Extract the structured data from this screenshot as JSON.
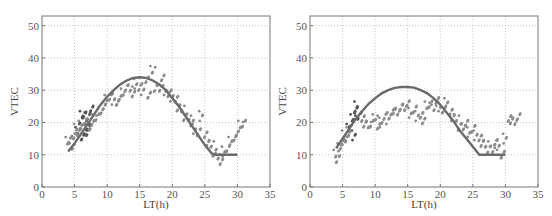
{
  "chart_data": [
    {
      "type": "scatter",
      "title": "",
      "xlabel": "LT(h)",
      "ylabel": "VTEC",
      "xlim": [
        0,
        35
      ],
      "ylim": [
        0,
        53
      ],
      "xticks": [
        0,
        5,
        10,
        15,
        20,
        25,
        30,
        35
      ],
      "yticks": [
        0,
        10,
        20,
        30,
        40,
        50
      ],
      "grid": true,
      "series": [
        {
          "name": "model curve",
          "kind": "line",
          "color": "#6a6a6a",
          "x": [
            4,
            5,
            6,
            7,
            8,
            9,
            10,
            11,
            12,
            13,
            14,
            15,
            16,
            17,
            18,
            19,
            20,
            21,
            22,
            23,
            24,
            25,
            26,
            26.5,
            27,
            28,
            29,
            30
          ],
          "y": [
            11,
            13.5,
            16.5,
            19.5,
            22.5,
            25.5,
            28,
            30,
            31.8,
            33,
            33.8,
            34,
            33.8,
            33,
            31.8,
            30,
            27.5,
            25,
            22,
            19,
            16,
            13,
            10.5,
            10,
            10,
            10,
            10,
            10
          ]
        },
        {
          "name": "observed (dark)",
          "kind": "scatter",
          "color": "#555555",
          "x": [
            5.5,
            6,
            6.2,
            6.5,
            6.8,
            7,
            7.2,
            7.5,
            6.3,
            6.6,
            7.1
          ],
          "y": [
            17,
            21,
            22,
            22.5,
            18,
            17,
            19,
            24,
            16,
            20,
            22
          ]
        },
        {
          "name": "observed (light)",
          "kind": "scatter",
          "color": "#8c8c8c",
          "x": [
            4,
            4.3,
            4.6,
            5,
            5.3,
            5.6,
            6,
            6.5,
            7.5,
            8,
            8.5,
            9,
            9.5,
            10,
            10.5,
            11,
            11.5,
            12,
            12.5,
            13,
            13.5,
            14,
            14.5,
            15,
            15.5,
            16,
            16.5,
            17,
            17.5,
            18,
            18.5,
            19,
            19.5,
            20,
            20.5,
            21,
            21.5,
            22,
            22.5,
            23,
            23.5,
            24,
            24.5,
            25,
            25.5,
            26,
            26.5,
            27,
            27.5,
            28,
            28.5,
            29,
            29.5,
            30,
            30.5,
            31
          ],
          "y": [
            14,
            15,
            12,
            16,
            18,
            17,
            19,
            20,
            19,
            21,
            22,
            23,
            25,
            27,
            28,
            27,
            26,
            28,
            29,
            31,
            30,
            29,
            32,
            31,
            30,
            33,
            29,
            36,
            31,
            30,
            34,
            30,
            29,
            28,
            27,
            25,
            24,
            22,
            21,
            20,
            18,
            17,
            22,
            16,
            14,
            13,
            11,
            9,
            8,
            11,
            12,
            14,
            15,
            17,
            19,
            20
          ]
        }
      ]
    },
    {
      "type": "scatter",
      "title": "",
      "xlabel": "LT(h)",
      "ylabel": "VTEC",
      "xlim": [
        0,
        35
      ],
      "ylim": [
        0,
        53
      ],
      "xticks": [
        0,
        5,
        10,
        15,
        20,
        25,
        30,
        35
      ],
      "yticks": [
        0,
        10,
        20,
        30,
        40,
        50
      ],
      "grid": true,
      "series": [
        {
          "name": "model curve",
          "kind": "line",
          "color": "#6a6a6a",
          "x": [
            4,
            5,
            6,
            7,
            8,
            9,
            10,
            11,
            12,
            13,
            14,
            15,
            16,
            17,
            18,
            19,
            20,
            21,
            22,
            23,
            24,
            25,
            26,
            27,
            28,
            29,
            30
          ],
          "y": [
            12,
            15,
            18,
            21,
            23.5,
            25.8,
            27.5,
            29,
            30,
            30.7,
            31,
            31,
            30.8,
            30,
            29,
            27.5,
            25.5,
            23,
            20.5,
            17.5,
            15,
            12.5,
            10,
            10,
            10,
            10,
            10
          ]
        },
        {
          "name": "observed (dark)",
          "kind": "scatter",
          "color": "#555555",
          "x": [
            6,
            6.3,
            6.6,
            7,
            7.2,
            7.5,
            6.8
          ],
          "y": [
            18,
            20,
            21,
            24,
            25,
            22,
            16
          ]
        },
        {
          "name": "observed (light)",
          "kind": "scatter",
          "color": "#8c8c8c",
          "x": [
            4,
            4.3,
            4.6,
            5,
            5.3,
            5.6,
            6,
            8,
            8.5,
            9,
            9.5,
            10,
            10.5,
            11,
            11.5,
            12,
            12.5,
            13,
            13.5,
            14,
            14.5,
            15,
            15.5,
            16,
            16.5,
            17,
            17.5,
            18,
            18.5,
            19,
            19.5,
            20,
            20.5,
            21,
            21.5,
            22,
            22.5,
            23,
            23.5,
            24,
            24.5,
            25,
            25.5,
            26,
            26.5,
            27,
            27.5,
            28,
            28.5,
            29,
            29.5,
            30,
            30.5,
            31,
            31.5,
            32
          ],
          "y": [
            10,
            9,
            12,
            14,
            16,
            15,
            17,
            21,
            20,
            19,
            20,
            21,
            19,
            20,
            22,
            21,
            23,
            24,
            23,
            25,
            24,
            26,
            23,
            24,
            22,
            22,
            21,
            25,
            26,
            24,
            27,
            25,
            24,
            26,
            23,
            22,
            21,
            19,
            18,
            20,
            17,
            18,
            16,
            15,
            14,
            13,
            12,
            11,
            14,
            13,
            10,
            15,
            21,
            21,
            20,
            22
          ]
        }
      ]
    }
  ],
  "charts": [
    {
      "xlabel": "LT(h)",
      "ylabel": "VTEC"
    },
    {
      "xlabel": "LT(h)",
      "ylabel": "VTEC"
    }
  ]
}
